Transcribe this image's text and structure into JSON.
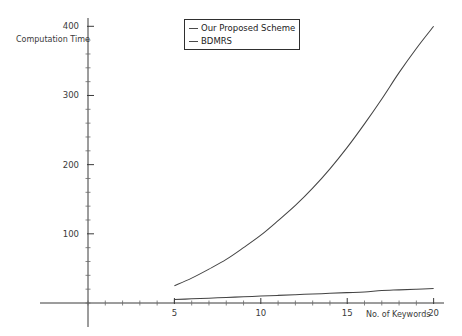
{
  "chart_data": {
    "type": "line",
    "title": "",
    "xlabel": "No. of Keywords",
    "ylabel": "Computation Time",
    "xlim": [
      0,
      20.6
    ],
    "ylim": [
      0,
      412
    ],
    "grid": false,
    "legend_position": "top-center",
    "x_ticks": [
      5,
      10,
      15,
      20
    ],
    "y_ticks": [
      100,
      200,
      300,
      400
    ],
    "x_minor_step": 1,
    "y_minor_step": 20,
    "x": [
      5,
      6,
      7,
      8,
      9,
      10,
      11,
      12,
      13,
      14,
      15,
      16,
      17,
      18,
      19,
      20
    ],
    "series": [
      {
        "name": "Our Proposed Scheme",
        "values": [
          25,
          36,
          49,
          63,
          80,
          98,
          119,
          141,
          166,
          194,
          225,
          259,
          295,
          333,
          368,
          400
        ]
      },
      {
        "name": "BDMRS",
        "values": [
          5,
          6,
          7,
          8,
          9,
          10,
          11,
          12,
          13,
          14,
          15,
          16,
          18,
          19,
          20,
          21
        ]
      }
    ]
  },
  "axes": {
    "y_title": "Computation Time",
    "x_title": "No. of Keywords",
    "y_tick_labels": [
      "100",
      "200",
      "300",
      "400"
    ],
    "x_tick_labels": [
      "5",
      "10",
      "15",
      "20"
    ]
  },
  "legend": {
    "entries": [
      {
        "label": "Our Proposed Scheme"
      },
      {
        "label": "BDMRS"
      }
    ]
  },
  "colors": {
    "series_stroke": "#444444",
    "axis": "#3a3a3a",
    "background": "#ffffff"
  }
}
